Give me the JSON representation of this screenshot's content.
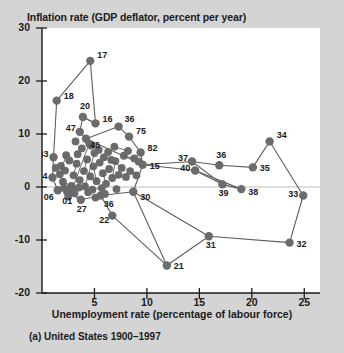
{
  "figure": {
    "caption": "(a) United States 1900–1997",
    "marker_color": "#6b6b6b",
    "line_color": "#5e5e5e",
    "plot_background": "#ffffff",
    "page_background": "#d4d4d4",
    "text_color": "#1b1b1b"
  },
  "chart_data": {
    "type": "scatter",
    "title": "",
    "subtitle": "",
    "ylabel": "Inflation rate (GDP deflator, percent per year)",
    "xlabel": "Unemployment rate (percentage of labour force)",
    "xlim": [
      0,
      26.5
    ],
    "ylim": [
      -20,
      30
    ],
    "xticks": [
      5,
      10,
      15,
      20,
      25
    ],
    "yticks": [
      30,
      20,
      10,
      0,
      -10,
      -20
    ],
    "xtick_labels": [
      "5",
      "10",
      "15",
      "20",
      "25"
    ],
    "ytick_labels": [
      "30",
      "20",
      "10",
      "0",
      "-10",
      "-20"
    ],
    "grid": false,
    "zero_line": true,
    "legend": "none",
    "annotation_note": "Connected scatter of annual US inflation vs unemployment; selected years labelled by last two digits.",
    "points": [
      {
        "label": "17",
        "x": 4.6,
        "y": 23.8
      },
      {
        "label": "18",
        "x": 1.4,
        "y": 16.3
      },
      {
        "label": "20",
        "x": 3.9,
        "y": 13.2
      },
      {
        "label": "16",
        "x": 5.1,
        "y": 12.0
      },
      {
        "label": "47",
        "x": 3.6,
        "y": 10.4
      },
      {
        "label": "46",
        "x": 4.2,
        "y": 9.1
      },
      {
        "label": "36",
        "x": 7.3,
        "y": 11.4
      },
      {
        "label": "75",
        "x": 8.3,
        "y": 9.5
      },
      {
        "label": "82",
        "x": 9.4,
        "y": 6.5
      },
      {
        "label": "43",
        "x": 1.1,
        "y": 5.6
      },
      {
        "label": "44",
        "x": 1.0,
        "y": 1.8
      },
      {
        "label": "15",
        "x": 9.6,
        "y": 4.2
      },
      {
        "label": "06",
        "x": 1.5,
        "y": -0.6
      },
      {
        "label": "01",
        "x": 2.4,
        "y": -0.9
      },
      {
        "label": "27",
        "x": 3.7,
        "y": -2.4
      },
      {
        "label": "36b",
        "x": 5.6,
        "y": -1.6
      },
      {
        "label": "30",
        "x": 8.7,
        "y": -0.9
      },
      {
        "label": "22",
        "x": 6.7,
        "y": -5.4
      },
      {
        "label": "21",
        "x": 11.9,
        "y": -14.8
      },
      {
        "label": "31",
        "x": 15.9,
        "y": -9.3
      },
      {
        "label": "32",
        "x": 23.6,
        "y": -10.5
      },
      {
        "label": "33",
        "x": 24.9,
        "y": -1.6
      },
      {
        "label": "34",
        "x": 21.7,
        "y": 8.6
      },
      {
        "label": "35",
        "x": 20.1,
        "y": 3.7
      },
      {
        "label": "37",
        "x": 14.3,
        "y": 4.8
      },
      {
        "label": "36c",
        "x": 16.9,
        "y": 4.1
      },
      {
        "label": "40",
        "x": 14.6,
        "y": 3.1
      },
      {
        "label": "39",
        "x": 17.2,
        "y": 0.5
      },
      {
        "label": "38",
        "x": 19.0,
        "y": -0.4
      }
    ],
    "labels_shown": [
      "17",
      "18",
      "20",
      "16",
      "47",
      "46",
      "36",
      "75",
      "82",
      "43",
      "44",
      "15",
      "06",
      "01",
      "27",
      "36",
      "30",
      "22",
      "21",
      "31",
      "32",
      "33",
      "34",
      "35",
      "37",
      "36",
      "40",
      "39",
      "38"
    ]
  }
}
